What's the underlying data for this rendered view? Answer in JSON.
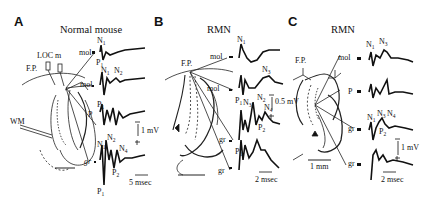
{
  "figure": {
    "panels": [
      {
        "letter": "A",
        "title": "Normal mouse",
        "diagram_labels": {
          "stim": "LOC m",
          "fp": "F.P.",
          "wm": "WM",
          "mol1": "mol",
          "mol2": "mol",
          "p": "P",
          "gr": "gr"
        },
        "traces": [
          {
            "site": "mol",
            "peaks": [
              "N1",
              "P1"
            ]
          },
          {
            "site": "mol",
            "peaks": [
              "N1",
              "N2",
              "P1"
            ]
          },
          {
            "site": "P",
            "peaks": [
              "P1"
            ]
          },
          {
            "site": "gr",
            "peaks": [
              "N1",
              "N2",
              "N4",
              "P2",
              "P1"
            ]
          }
        ],
        "scale": {
          "voltage": "1 mV",
          "time": "5 msec"
        }
      },
      {
        "letter": "B",
        "title": "RMN",
        "diagram_labels": {
          "fp": "F.P.",
          "mol1": "mol",
          "mol2": "mol",
          "gr1": "gr",
          "gr2": "gr"
        },
        "traces": [
          {
            "site": "mol",
            "peaks": [
              "N1"
            ]
          },
          {
            "site": "mol",
            "peaks": [
              "N3",
              "P1"
            ]
          },
          {
            "site": "gr",
            "peaks": [
              "N3",
              "N2",
              "N4",
              "P2"
            ]
          },
          {
            "site": "gr",
            "peaks": [
              "P1"
            ]
          }
        ],
        "scale": {
          "voltage": "0.5 mV",
          "time": "2 msec"
        }
      },
      {
        "letter": "C",
        "title": "RMN",
        "diagram_labels": {
          "fp": "F.P.",
          "mol": "mol",
          "p": "P",
          "gr1": "gr",
          "gr2": "gr",
          "scale_bar": "1 mm"
        },
        "traces": [
          {
            "site": "mol",
            "peaks": [
              "N1",
              "N3"
            ]
          },
          {
            "site": "P",
            "peaks": []
          },
          {
            "site": "gr",
            "peaks": [
              "N1",
              "N3",
              "N4",
              "P2"
            ]
          },
          {
            "site": "gr",
            "peaks": []
          }
        ],
        "scale": {
          "voltage": "1 mV",
          "time": "2 msec"
        }
      }
    ]
  },
  "text": {
    "A": "A",
    "B": "B",
    "C": "C",
    "A_title": "Normal mouse",
    "B_title": "RMN",
    "C_title": "RMN",
    "N": "N",
    "P": "P",
    "mol": "mol",
    "gr": "gr",
    "Pcell": "P",
    "FP": "F.P.",
    "LOC": "LOC m",
    "WM": "WM",
    "s1": "1",
    "s2": "2",
    "s3": "3",
    "s4": "4",
    "A_mv": "1 mV",
    "A_ms": "5 msec",
    "B_mv": "0.5 mV",
    "B_ms": "2 msec",
    "C_mv": "1 mV",
    "C_ms": "2 msec",
    "C_mm": "1 mm"
  }
}
